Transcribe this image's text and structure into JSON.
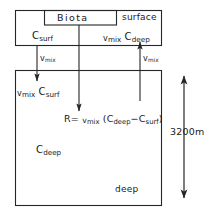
{
  "diagram": {
    "type": "box-model-schematic",
    "colors": {
      "line": "#262626",
      "text": "#1a1a1a",
      "background": "#ffffff"
    },
    "boxes": {
      "surface": {
        "label": "surface",
        "concentration_label": "C",
        "concentration_sub": "surf"
      },
      "biota": {
        "label": "Biota"
      },
      "deep": {
        "label": "deep",
        "concentration_label": "C",
        "concentration_sub": "deep"
      }
    },
    "flux_labels": {
      "upward_flux": {
        "rate": "v",
        "rate_sub": "mix",
        "concentration": "C",
        "concentration_sub": "deep"
      },
      "downward_flux": {
        "rate": "v",
        "rate_sub": "mix",
        "concentration": "C",
        "concentration_sub": "surf"
      },
      "mixing_rate_left": {
        "symbol": "v",
        "symbol_sub": "mix"
      },
      "mixing_rate_right": {
        "symbol": "v",
        "symbol_sub": "mix"
      }
    },
    "equation": {
      "lhs": "R",
      "equals": "=",
      "rate": "v",
      "rate_sub": "mix",
      "open_paren": "(",
      "term1": "C",
      "term1_sub": "deep",
      "minus": "−",
      "term2": "C",
      "term2_sub": "surf",
      "close_paren": ")"
    },
    "scale": {
      "depth_label": "3200m"
    }
  }
}
